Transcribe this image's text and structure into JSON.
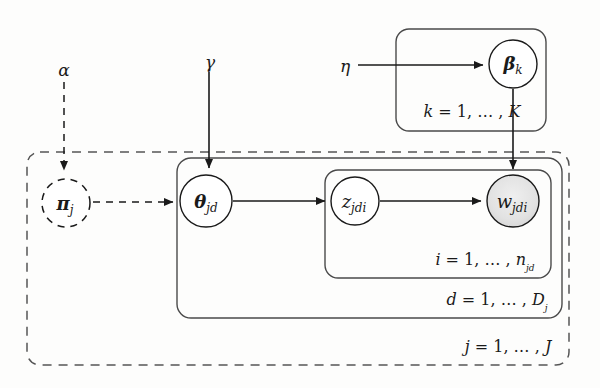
{
  "diagram": {
    "type": "plate-notation-graphical-model",
    "title_visible": "",
    "nodes": [
      {
        "id": "alpha",
        "label": "α",
        "kind": "hyperparameter-text",
        "style": "plain",
        "x": 64,
        "y": 70
      },
      {
        "id": "gamma",
        "label": "γ",
        "kind": "hyperparameter-text",
        "style": "plain",
        "x": 210,
        "y": 62
      },
      {
        "id": "eta",
        "label": "η",
        "kind": "hyperparameter-text",
        "style": "plain",
        "x": 345,
        "y": 66
      },
      {
        "id": "beta",
        "label": "β",
        "sub": "k",
        "kind": "latent-variable",
        "style": "solid-circle",
        "x": 513,
        "y": 64,
        "r": 24,
        "bold": true
      },
      {
        "id": "pi",
        "label": "π",
        "sub": "j",
        "kind": "latent-variable",
        "style": "dashed-circle",
        "x": 66,
        "y": 203,
        "r": 24,
        "bold": true
      },
      {
        "id": "theta",
        "label": "θ",
        "sub": "jd",
        "kind": "latent-variable",
        "style": "solid-circle",
        "x": 206,
        "y": 201,
        "r": 26,
        "bold": true
      },
      {
        "id": "z",
        "label": "z",
        "sub": "jdi",
        "kind": "latent-variable",
        "style": "solid-circle",
        "x": 355,
        "y": 201,
        "r": 24,
        "bold": false
      },
      {
        "id": "w",
        "label": "w",
        "sub": "jdi",
        "kind": "observed-variable",
        "style": "shaded-circle",
        "x": 513,
        "y": 201,
        "r": 26,
        "bold": false
      }
    ],
    "edges": [
      {
        "from": "alpha",
        "to": "pi",
        "style": "dashed",
        "direction": "down"
      },
      {
        "from": "gamma",
        "to": "theta",
        "style": "solid",
        "direction": "down"
      },
      {
        "from": "eta",
        "to": "beta",
        "style": "solid",
        "direction": "right"
      },
      {
        "from": "pi",
        "to": "theta",
        "style": "dashed",
        "direction": "right"
      },
      {
        "from": "theta",
        "to": "z",
        "style": "solid",
        "direction": "right"
      },
      {
        "from": "z",
        "to": "w",
        "style": "solid",
        "direction": "right"
      },
      {
        "from": "beta",
        "to": "w",
        "style": "solid",
        "direction": "down"
      }
    ],
    "plates": [
      {
        "id": "plate-k",
        "label": "k = 1, … , K",
        "label_text_parts": {
          "index": "k",
          "eq": "= 1,",
          "dots": "… ,",
          "limit": "K"
        },
        "style": "solid-rounded",
        "x": 396,
        "y": 29,
        "w": 150,
        "h": 102,
        "label_x": 530,
        "label_y": 112
      },
      {
        "id": "plate-j",
        "label": "j = 1, … , J",
        "label_text_parts": {
          "index": "j",
          "eq": "= 1,",
          "dots": "… ,",
          "limit": "J"
        },
        "style": "dashed-rounded",
        "x": 27,
        "y": 152,
        "w": 542,
        "h": 213,
        "label_x": 552,
        "label_y": 347
      },
      {
        "id": "plate-d",
        "label": "d = 1, … , D",
        "label_text_parts": {
          "index": "d",
          "eq": "= 1,",
          "dots": "… ,",
          "limit": "D",
          "limit_sub": "j"
        },
        "style": "solid-rounded",
        "x": 177,
        "y": 158,
        "w": 385,
        "h": 160,
        "label_x": 546,
        "label_y": 300
      },
      {
        "id": "plate-i",
        "label": "i = 1, … , n",
        "label_text_parts": {
          "index": "i",
          "eq": "= 1,",
          "dots": "… ,",
          "limit": "n",
          "limit_sub": "jd"
        },
        "style": "solid-rounded",
        "x": 325,
        "y": 170,
        "w": 226,
        "h": 108,
        "label_x": 535,
        "label_y": 260
      }
    ],
    "colors": {
      "stroke": "#1a1a1a",
      "observed_fill": "#e0e0e0",
      "background": "#fdfdfc"
    }
  }
}
